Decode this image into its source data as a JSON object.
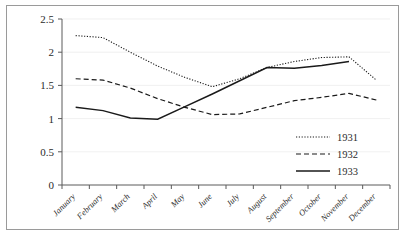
{
  "chart_data": {
    "type": "line",
    "title": "",
    "xlabel": "",
    "ylabel": "",
    "categories": [
      "January",
      "February",
      "March",
      "April",
      "May",
      "June",
      "July",
      "August",
      "September",
      "October",
      "November",
      "December"
    ],
    "ylim": [
      0,
      2.5
    ],
    "yticks": [
      "0",
      "0.5",
      "1",
      "1.5",
      "2",
      "2.5"
    ],
    "ytick_values": [
      0,
      0.5,
      1,
      1.5,
      2,
      2.5
    ],
    "grid": false,
    "legend_position": "right-inside",
    "series": [
      {
        "name": "1931",
        "style": "dotted",
        "color": "#1a1a1a",
        "values": [
          2.25,
          2.22,
          2.0,
          1.79,
          1.62,
          1.48,
          1.6,
          1.77,
          1.86,
          1.92,
          1.93,
          1.58
        ]
      },
      {
        "name": "1932",
        "style": "dashed",
        "color": "#1a1a1a",
        "values": [
          1.6,
          1.58,
          1.46,
          1.3,
          1.17,
          1.06,
          1.07,
          1.17,
          1.27,
          1.32,
          1.38,
          1.28
        ]
      },
      {
        "name": "1933",
        "style": "solid",
        "color": "#1a1a1a",
        "values": [
          1.17,
          1.12,
          1.01,
          0.99,
          1.18,
          1.37,
          1.57,
          1.77,
          1.76,
          1.8,
          1.86,
          null
        ]
      }
    ]
  },
  "legend": {
    "entries": [
      {
        "label": "1931"
      },
      {
        "label": "1932"
      },
      {
        "label": "1933"
      }
    ]
  }
}
